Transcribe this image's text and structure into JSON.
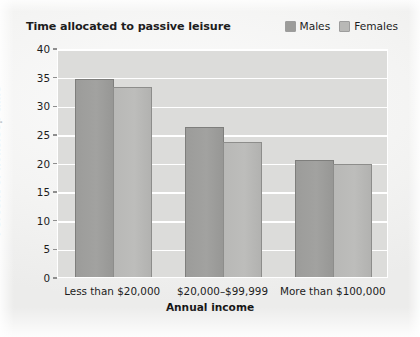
{
  "chart_title": "Time allocated to passive leisure",
  "legend": {
    "position": "top-right",
    "entries": [
      {
        "label": "Males",
        "color": "#9c9c9a",
        "icon": "legend-swatch-icon"
      },
      {
        "label": "Females",
        "color": "#b8b8b6",
        "icon": "legend-swatch-icon"
      }
    ]
  },
  "chart_data": {
    "type": "bar",
    "title": "Time allocated to passive leisure",
    "xlabel": "Annual income",
    "ylabel": "Percent of nonsleep time",
    "categories": [
      "Less than $20,000",
      "$20,000–$99,999",
      "More than $100,000"
    ],
    "series": [
      {
        "name": "Males",
        "color": "#9c9c9a",
        "values": [
          34.8,
          26.3,
          20.6
        ]
      },
      {
        "name": "Females",
        "color": "#b8b8b6",
        "values": [
          33.4,
          23.8,
          20.0
        ]
      }
    ],
    "ylim": [
      0,
      40
    ],
    "yticks": [
      0,
      5,
      10,
      15,
      20,
      25,
      30,
      35,
      40
    ],
    "ytick_labels": [
      "0",
      "5",
      "10",
      "15",
      "20",
      "25",
      "30",
      "35",
      "40"
    ],
    "grid": true,
    "grid_color": "#ffffff",
    "plot_background": "#dcdcda"
  }
}
